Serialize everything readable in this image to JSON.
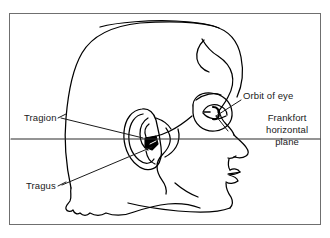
{
  "figure": {
    "title_description": "Side profile line drawing of a human head showing the Frankfort horizontal plane",
    "background_color": "#ffffff",
    "frame_color": "#6f6f6f",
    "ink_color": "#000000"
  },
  "labels": {
    "tragion": "Tragion",
    "tragus": "Tragus",
    "orbit_of_eye": "Orbit of eye",
    "frankfort_line_1": "Frankfort",
    "frankfort_line_2": "horizontal",
    "frankfort_line_3": "plane"
  },
  "annotations": {
    "leader_lines": [
      {
        "name": "tragion-leader",
        "from": "Tragion label",
        "to": "tragion point on ear"
      },
      {
        "name": "tragus-leader",
        "from": "Tragus label",
        "to": "tragus of ear"
      },
      {
        "name": "orbit-leader",
        "from": "Orbit of eye label",
        "to": "eye orbit"
      }
    ],
    "horizontal_plane": {
      "name": "frankfort-horizontal-plane-line",
      "description": "Horizontal reference line spanning the full figure width through the tragion and the inferior orbital margin"
    }
  },
  "anatomy_parts": [
    "cranium-outline",
    "hairline",
    "forehead",
    "brow",
    "eye",
    "eye-orbit",
    "nose",
    "lips",
    "chin",
    "jaw",
    "neck",
    "ear",
    "tragus",
    "nape-hairline"
  ]
}
